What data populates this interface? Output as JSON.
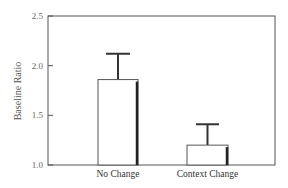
{
  "chart_data": {
    "type": "bar",
    "title": "",
    "xlabel": "",
    "ylabel": "Baseline Ratio",
    "ylim": [
      1.0,
      2.5
    ],
    "yticks": [
      "1.0",
      "1.5",
      "2.0",
      "2.5"
    ],
    "categories": [
      "No Change",
      "Context Change"
    ],
    "values": [
      1.86,
      1.2
    ],
    "error_upper": [
      2.12,
      1.41
    ],
    "grid": false,
    "legend": null
  }
}
